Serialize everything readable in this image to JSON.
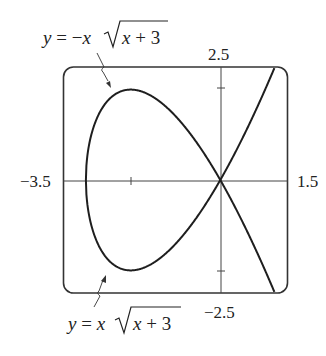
{
  "chart_data": {
    "type": "line",
    "title": "",
    "xlabel": "",
    "ylabel": "",
    "xlim": [
      -3.5,
      1.5
    ],
    "ylim": [
      -2.5,
      2.5
    ],
    "grid": false,
    "x_ticks": [
      -2,
      1
    ],
    "y_ticks": [
      -2,
      2
    ],
    "range_labels": {
      "xmin": "−3.5",
      "xmax": "1.5",
      "ymin": "−2.5",
      "ymax": "2.5"
    },
    "series": [
      {
        "name": "y = −x√(x + 3)",
        "formula": "-x*sqrt(x+3)",
        "domain": [
          -3,
          1.5
        ],
        "points": [
          [
            -3,
            0
          ],
          [
            -2.5,
            1.77
          ],
          [
            -2,
            2
          ],
          [
            -1.5,
            1.84
          ],
          [
            -1,
            1.41
          ],
          [
            -0.5,
            0.79
          ],
          [
            0,
            0
          ],
          [
            0.5,
            -0.94
          ],
          [
            1,
            -2
          ],
          [
            1.5,
            -3.18
          ]
        ]
      },
      {
        "name": "y = x√(x + 3)",
        "formula": "x*sqrt(x+3)",
        "domain": [
          -3,
          1.5
        ],
        "points": [
          [
            -3,
            0
          ],
          [
            -2.5,
            -1.77
          ],
          [
            -2,
            -2
          ],
          [
            -1.5,
            -1.84
          ],
          [
            -1,
            -1.41
          ],
          [
            -0.5,
            -0.79
          ],
          [
            0,
            0
          ],
          [
            0.5,
            0.94
          ],
          [
            1,
            2
          ],
          [
            1.5,
            3.18
          ]
        ]
      }
    ],
    "annotations": [
      {
        "text": "y = −x√(x + 3)",
        "points_to": "upper branch",
        "position": "top-left"
      },
      {
        "text": "y = x√(x + 3)",
        "points_to": "lower branch",
        "position": "bottom-left"
      }
    ]
  },
  "labels": {
    "top_eq": {
      "y": "y",
      "eq": " = ",
      "neg": "−",
      "x": "x",
      "rad_x": "x",
      "rad_rest": " + 3"
    },
    "bottom_eq": {
      "y": "y",
      "eq": " = ",
      "x": "x",
      "rad_x": "x",
      "rad_rest": " + 3"
    },
    "xmin": "−3.5",
    "xmax": "1.5",
    "ymin": "−2.5",
    "ymax": "2.5"
  },
  "colors": {
    "curve": "#1e1e1e",
    "axis": "#333333",
    "frame": "#333333"
  }
}
